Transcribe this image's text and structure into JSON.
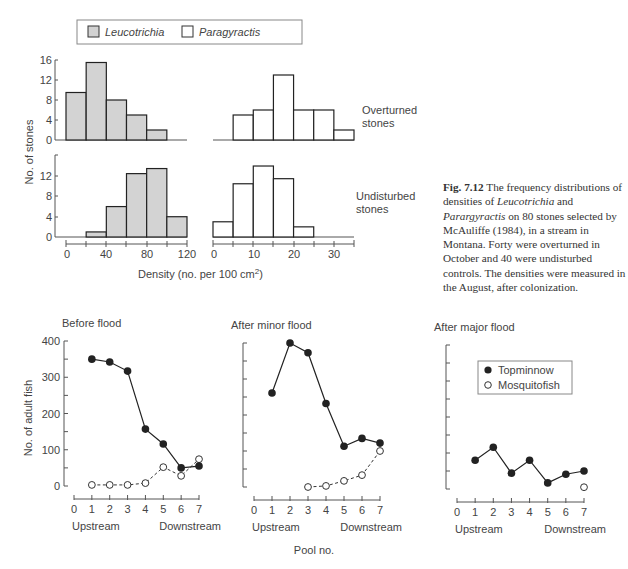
{
  "chart_data": [
    {
      "type": "bar",
      "panel": "histogram-overturned-leucotrichia",
      "series": "Leucotrichia",
      "group": "Overturned stones",
      "bin_edges": [
        0,
        20,
        40,
        60,
        80,
        100,
        120
      ],
      "values": [
        9.5,
        15.5,
        8,
        5,
        2,
        0
      ],
      "xlim": [
        0,
        120
      ],
      "ylim": [
        0,
        16
      ],
      "yticks": [
        0,
        4,
        8,
        12,
        16
      ]
    },
    {
      "type": "bar",
      "panel": "histogram-overturned-paragyractis",
      "series": "Paragyractis",
      "group": "Overturned stones",
      "bin_edges": [
        0,
        5,
        10,
        15,
        20,
        25,
        30,
        35
      ],
      "values": [
        0,
        5,
        6,
        13,
        6,
        6,
        2
      ],
      "xlim": [
        0,
        35
      ],
      "ylim": [
        0,
        16
      ]
    },
    {
      "type": "bar",
      "panel": "histogram-undisturbed-leucotrichia",
      "series": "Leucotrichia",
      "group": "Undisturbed stones",
      "bin_edges": [
        0,
        20,
        40,
        60,
        80,
        100,
        120
      ],
      "values": [
        0,
        1,
        6,
        12.5,
        13.5,
        4
      ],
      "xlim": [
        0,
        120
      ],
      "ylim": [
        0,
        16
      ],
      "xticks": [
        0,
        40,
        80,
        120
      ],
      "yticks": [
        0,
        4,
        8,
        12
      ]
    },
    {
      "type": "bar",
      "panel": "histogram-undisturbed-paragyractis",
      "series": "Paragyractis",
      "group": "Undisturbed stones",
      "bin_edges": [
        0,
        5,
        10,
        15,
        20,
        25,
        30,
        35
      ],
      "values": [
        3,
        10.5,
        14,
        11.5,
        2,
        0,
        0
      ],
      "xlim": [
        0,
        35
      ],
      "ylim": [
        0,
        16
      ],
      "xticks": [
        0,
        10,
        20,
        30
      ]
    },
    {
      "type": "line",
      "panel": "before-flood",
      "title": "Before flood",
      "x": [
        1,
        2,
        3,
        4,
        5,
        6,
        7
      ],
      "series": [
        {
          "name": "Topminnow",
          "marker": "filled-circle",
          "line": "solid",
          "values": [
            350,
            342,
            317,
            157,
            116,
            50,
            55
          ]
        },
        {
          "name": "Mosquitofish",
          "marker": "open-circle",
          "line": "dashed",
          "values": [
            3,
            3,
            3,
            8,
            52,
            28,
            74
          ]
        }
      ],
      "xlim": [
        0,
        7
      ],
      "ylim": [
        0,
        400
      ],
      "yticks": [
        0,
        100,
        200,
        300,
        400
      ]
    },
    {
      "type": "line",
      "panel": "after-minor-flood",
      "title": "After minor flood",
      "x": [
        1,
        2,
        3,
        4,
        5,
        6,
        7
      ],
      "series": [
        {
          "name": "Topminnow",
          "marker": "filled-circle",
          "line": "solid",
          "values": [
            261,
            400,
            373,
            232,
            113,
            135,
            122
          ]
        },
        {
          "name": "Mosquitofish",
          "marker": "open-circle",
          "line": "dashed",
          "x": [
            3,
            4,
            5,
            6,
            7
          ],
          "values": [
            0,
            3,
            17,
            33,
            100
          ]
        }
      ],
      "xlim": [
        0,
        7
      ],
      "ylim": [
        0,
        400
      ]
    },
    {
      "type": "line",
      "panel": "after-major-flood",
      "title": "After major flood",
      "x": [
        1,
        2,
        3,
        4,
        5,
        6,
        7
      ],
      "series": [
        {
          "name": "Topminnow",
          "marker": "filled-circle",
          "line": "solid",
          "values": [
            80,
            116,
            44,
            80,
            17,
            41,
            50
          ]
        },
        {
          "name": "Mosquitofish",
          "marker": "open-circle",
          "line": "none",
          "x": [
            7
          ],
          "values": [
            5
          ]
        }
      ],
      "xlim": [
        0,
        7
      ],
      "ylim": [
        0,
        400
      ]
    }
  ],
  "top_figure": {
    "legend": {
      "leucotrichia": "Leucotrichia",
      "paragyractis": "Paragyractis"
    },
    "ylabel": "No. of stones",
    "xlabel": "Density (no. per 100 cm",
    "xlabel_sup": "2",
    "xlabel_end": ")",
    "row_labels": {
      "overturned_1": "Overturned",
      "overturned_2": "stones",
      "undisturbed_1": "Undisturbed",
      "undisturbed_2": "stones"
    },
    "left_yticks_top": [
      "16",
      "12",
      "8",
      "4",
      "0"
    ],
    "left_yticks_bottom": [
      "12",
      "8",
      "4",
      "0"
    ],
    "left_xticks": [
      "0",
      "40",
      "80",
      "120"
    ],
    "right_xticks": [
      "0",
      "10",
      "20",
      "30"
    ],
    "caption": {
      "fig_no": "Fig. 7.12",
      "t1": " The frequency distributions of densities of ",
      "sp1": "Leucotrichia",
      "t2": " and ",
      "sp2": "Parargyractis",
      "t3": " on 80 stones selected by McAuliffe (1984), in a stream in Montana. Forty were overturned in October and 40 were undisturbed controls. The densities were measured in the August, after colonization."
    }
  },
  "bottom_figure": {
    "ylabel": "No. of adult fish",
    "xlabel": "Pool no.",
    "panel_titles": [
      "Before flood",
      "After minor flood",
      "After major flood"
    ],
    "yticks": [
      "400",
      "300",
      "200",
      "100",
      "0"
    ],
    "xticks": [
      "0",
      "1",
      "2",
      "3",
      "4",
      "5",
      "6",
      "7"
    ],
    "upstream": "Upstream",
    "downstream": "Downstream",
    "legend": {
      "topminnow": "Topminnow",
      "mosquitofish": "Mosquitofish"
    }
  }
}
